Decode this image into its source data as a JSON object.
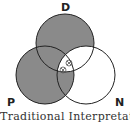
{
  "diagram": {
    "type": "venn-3",
    "circles": [
      {
        "id": "D",
        "label": "D",
        "cx": 65,
        "cy": 43,
        "r": 29
      },
      {
        "id": "P",
        "label": "P",
        "cx": 45,
        "cy": 75,
        "r": 29
      },
      {
        "id": "N",
        "label": "N",
        "cx": 86,
        "cy": 75,
        "r": 29
      }
    ],
    "shaded_regions": [
      "D only",
      "P only",
      "D∩P not N",
      "P∩N not D"
    ],
    "unshaded_regions": [
      "N only",
      "D∩N not P",
      "D∩P∩N"
    ],
    "marks": [
      {
        "symbol": "⊗",
        "region": "D∩N not P",
        "x": 69,
        "y": 63
      },
      {
        "symbol": "⊗",
        "region": "D∩P∩N",
        "x": 63,
        "y": 70
      }
    ],
    "shade_color": "#8a8a8a",
    "stroke_color": "#222222",
    "caption": "Traditional Interpretation"
  }
}
